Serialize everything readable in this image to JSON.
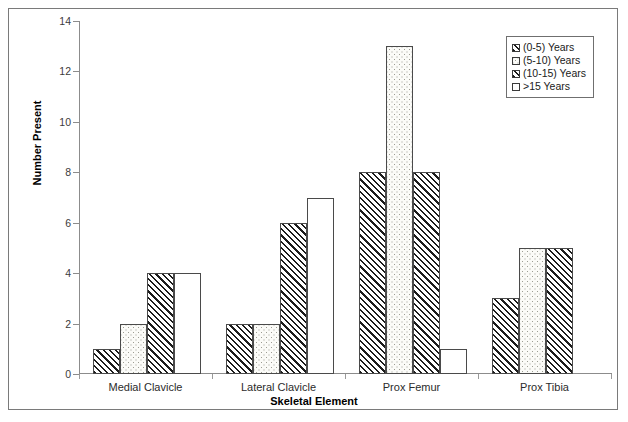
{
  "chart_data": {
    "type": "bar",
    "title": "",
    "xlabel": "Skeletal Element",
    "ylabel": "Number Present",
    "ylim": [
      0,
      14
    ],
    "ytick_step": 2,
    "yticks": [
      0,
      2,
      4,
      6,
      8,
      10,
      12,
      14
    ],
    "grid": false,
    "legend_position": "top-right",
    "categories": [
      "Medial Clavicle",
      "Lateral Clavicle",
      "Prox Femur",
      "Prox Tibia"
    ],
    "series": [
      {
        "name": "(0-5) Years",
        "pattern": "diagonal-hatch",
        "values": [
          1,
          2,
          8,
          3
        ]
      },
      {
        "name": "(5-10) Years",
        "pattern": "dotted",
        "values": [
          2,
          2,
          13,
          5
        ]
      },
      {
        "name": "(10-15) Years",
        "pattern": "diagonal-hatch",
        "values": [
          4,
          6,
          8,
          5
        ]
      },
      {
        "name": ">15 Years",
        "pattern": "plain-white",
        "values": [
          4,
          7,
          1,
          0
        ]
      }
    ]
  },
  "axes": {
    "y_label": "Number Present",
    "x_label": "Skeletal Element",
    "y_tick_labels": [
      "0",
      "2",
      "4",
      "6",
      "8",
      "10",
      "12",
      "14"
    ],
    "x_tick_labels": [
      "Medial Clavicle",
      "Lateral Clavicle",
      "Prox Femur",
      "Prox Tibia"
    ]
  },
  "legend": {
    "items": [
      {
        "label": "(0-5) Years",
        "pattern": "diagonal-hatch"
      },
      {
        "label": "(5-10) Years",
        "pattern": "dotted"
      },
      {
        "label": "(10-15) Years",
        "pattern": "diagonal-hatch"
      },
      {
        "label": ">15 Years",
        "pattern": "plain-white"
      }
    ]
  },
  "colors": {
    "axis": "#8c8c8c",
    "frame": "#7a7a7a",
    "bar_outline": "#4a4a4a",
    "hatch": "#1c1c1c",
    "dots": "#9c9c92",
    "text": "#1a1a1a",
    "background": "#ffffff"
  }
}
